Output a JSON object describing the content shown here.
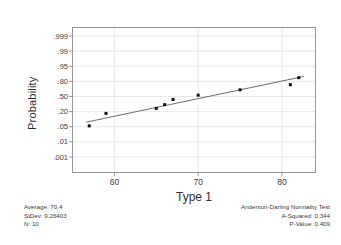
{
  "chart_data": {
    "type": "scatter",
    "title": "",
    "subtitle": "",
    "xlabel": "Type 1",
    "ylabel": "Probability",
    "grid": true,
    "legend": "none",
    "xlim": [
      55.0,
      84.0
    ],
    "ylim_probability": [
      0.001,
      0.999
    ],
    "x_ticks": [
      60,
      70,
      80
    ],
    "x_tick_labels": [
      "60",
      "70",
      "80"
    ],
    "y_ticks": [
      0.999,
      0.99,
      0.95,
      0.8,
      0.5,
      0.2,
      0.05,
      0.01,
      0.001
    ],
    "y_tick_labels": [
      ".999",
      ".99",
      ".95",
      ".80",
      ".50",
      ".20",
      ".05",
      ".01",
      ".001"
    ],
    "y_scale": "normal-probability",
    "points": [
      {
        "x": 57.0,
        "p": 0.055
      },
      {
        "x": 59.0,
        "p": 0.175
      },
      {
        "x": 65.0,
        "p": 0.255
      },
      {
        "x": 66.0,
        "p": 0.325
      },
      {
        "x": 67.0,
        "p": 0.435
      },
      {
        "x": 70.0,
        "p": 0.53
      },
      {
        "x": 75.0,
        "p": 0.645
      },
      {
        "x": 81.0,
        "p": 0.745
      },
      {
        "x": 82.0,
        "p": 0.85
      }
    ],
    "fit_line": {
      "label": "normal fit line",
      "x_start": 56.6,
      "p_start": 0.08,
      "x_end": 82.6,
      "p_end": 0.865
    },
    "marker": {
      "shape": "square",
      "color": "#101010",
      "size_px": 3
    },
    "line_color": "#5a5a66",
    "grid_color": "#d7d7dd",
    "frame_color": "#8a8a92"
  },
  "axes": {
    "y_title": "Probability",
    "x_title": "Type 1"
  },
  "stats_left": {
    "average_label": "Average: 70.4",
    "stdev_label": "StDev: 9.26403",
    "n_label": "N: 10"
  },
  "stats_right": {
    "test_title": "Anderson-Darling Normality Test",
    "a_squared_label": "A-Squared: 0.344",
    "p_value_label": "P-Value:   0.409"
  }
}
